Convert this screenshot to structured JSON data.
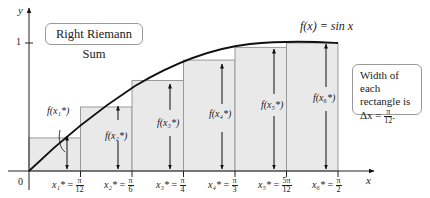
{
  "title_box": "Right Riemann Sum",
  "function_label": "f(x) = sin x",
  "info_box": {
    "line1": "Width of each",
    "line2": "rectangle is",
    "line3_prefix": "Δx = ",
    "frac_num": "π",
    "frac_den": "12",
    "suffix": "."
  },
  "axes": {
    "x_label": "x",
    "y_label": "y",
    "origin_label": "0",
    "y_tick_label": "1"
  },
  "sample_points": [
    {
      "label": "x₁*",
      "value_num": "π",
      "value_den": "12",
      "f_label": "f(x₁*)"
    },
    {
      "label": "x₂*",
      "value_num": "π",
      "value_den": "6",
      "f_label": "f(x₂*)"
    },
    {
      "label": "x₃*",
      "value_num": "π",
      "value_den": "4",
      "f_label": "f(x₃*)"
    },
    {
      "label": "x₄*",
      "value_num": "π",
      "value_den": "3",
      "f_label": "f(x₄*)"
    },
    {
      "label": "x₅*",
      "value_num": "5π",
      "value_den": "12",
      "f_label": "f(x₅*)"
    },
    {
      "label": "x₆*",
      "value_num": "π",
      "value_den": "2",
      "f_label": "f(x₆*)"
    }
  ],
  "colors": {
    "rect_fill": "#e8e8e8",
    "rect_stroke": "#9a9a9a",
    "curve": "#111111"
  }
}
